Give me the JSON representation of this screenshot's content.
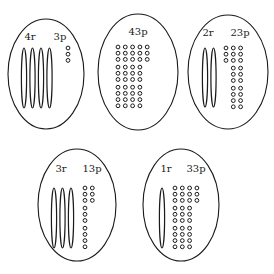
{
  "legend": {
    "r": "rods (groups of ten)",
    "p": "pieces / beads (ones)"
  },
  "groups": [
    {
      "id": "group-4r-3p",
      "labels": [
        "4r",
        "3p"
      ],
      "rods": 4,
      "beads": 3,
      "bead_layout": "single-column"
    },
    {
      "id": "group-43p",
      "labels": [
        "43p"
      ],
      "rods": 0,
      "beads": 43,
      "bead_layout": "columns-of-ten-leftover-right"
    },
    {
      "id": "group-2r-23p",
      "labels": [
        "2r",
        "23p"
      ],
      "rods": 2,
      "beads": 23,
      "bead_layout": "columns-of-ten-leftover-left"
    },
    {
      "id": "group-3r-13p",
      "labels": [
        "3r",
        "13p"
      ],
      "rods": 3,
      "beads": 13,
      "bead_layout": "columns-of-ten-leftover-right"
    },
    {
      "id": "group-1r-33p",
      "labels": [
        "1r",
        "33p"
      ],
      "rods": 1,
      "beads": 33,
      "bead_layout": "columns-of-ten-leftover-right"
    }
  ]
}
